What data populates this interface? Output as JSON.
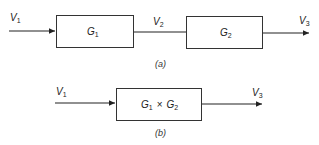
{
  "diagram_a": {
    "caption": "(a)",
    "input": {
      "main": "V",
      "sub": "1"
    },
    "block1": {
      "main": "G",
      "sub": "1"
    },
    "middle": {
      "main": "V",
      "sub": "2"
    },
    "block2": {
      "main": "G",
      "sub": "2"
    },
    "output": {
      "main": "V",
      "sub": "3"
    }
  },
  "diagram_b": {
    "caption": "(b)",
    "input": {
      "main": "V",
      "sub": "1"
    },
    "block": {
      "g1_main": "G",
      "g1_sub": "1",
      "op": "×",
      "g2_main": "G",
      "g2_sub": "2"
    },
    "output": {
      "main": "V",
      "sub": "3"
    }
  }
}
